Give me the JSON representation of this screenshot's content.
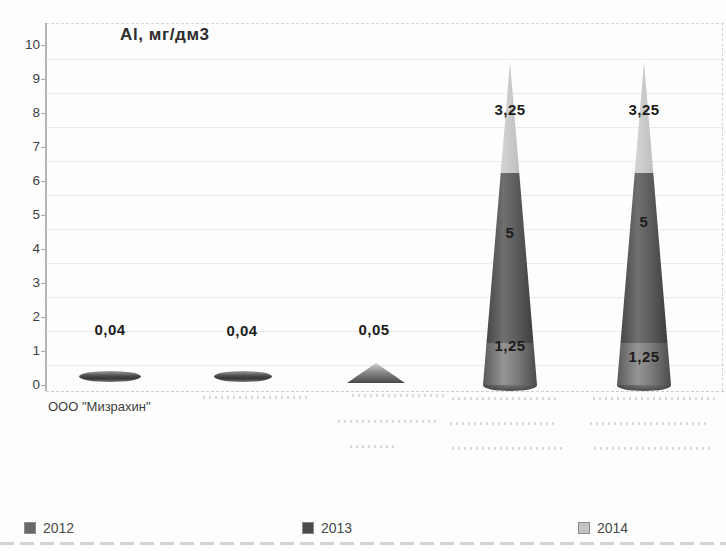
{
  "chart": {
    "title": "Al, мг/дм3",
    "legend": [
      {
        "label": "2012",
        "color": "#696969"
      },
      {
        "label": "2013",
        "color": "#4a4a4a"
      },
      {
        "label": "2014",
        "color": "#c2c2c2"
      }
    ],
    "x_axis": {
      "first_label": "ООО \"Мизрахин\"",
      "other_labels_illegible": true
    }
  },
  "chart_data": {
    "type": "bar",
    "variant": "3d-stacked-cone",
    "title": "Al, мг/дм3",
    "ylabel": "Al, мг/дм3",
    "xlabel": "",
    "ylim": [
      0,
      10
    ],
    "yticks": [
      "0",
      "1",
      "2",
      "3",
      "4",
      "5",
      "6",
      "7",
      "8",
      "9",
      "10"
    ],
    "grid": true,
    "legend_position": "bottom",
    "categories": [
      "ООО \"Мизрахин\"",
      "(illegible)",
      "(illegible)",
      "(illegible)",
      "(illegible)"
    ],
    "series": [
      {
        "name": "2012",
        "color": "#7a7a7a",
        "values": [
          0.04,
          0.04,
          0.05,
          1.25,
          1.25
        ]
      },
      {
        "name": "2013",
        "color": "#4a4a4a",
        "values": [
          null,
          null,
          null,
          5,
          5
        ]
      },
      {
        "name": "2014",
        "color": "#c2c2c2",
        "values": [
          null,
          null,
          null,
          3.25,
          3.25
        ]
      }
    ],
    "data_labels": [
      [
        "0,04"
      ],
      [
        "0,04"
      ],
      [
        "0,05"
      ],
      [
        "1,25",
        "5",
        "3,25"
      ],
      [
        "1,25",
        "5",
        "3,25"
      ]
    ]
  }
}
